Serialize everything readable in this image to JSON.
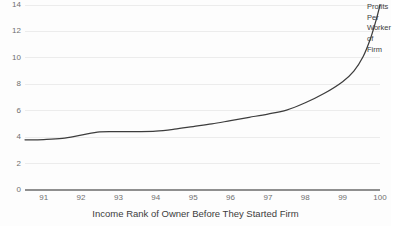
{
  "chart_data": {
    "type": "line",
    "title": "",
    "xlabel": "Income Rank of Owner Before They Started Firm",
    "ylabel": "",
    "xlim": [
      90.5,
      100
    ],
    "ylim": [
      0,
      14
    ],
    "grid": true,
    "legend_position": "right-of-line-end",
    "x_ticks": [
      "91",
      "92",
      "93",
      "94",
      "95",
      "96",
      "97",
      "98",
      "99",
      "100"
    ],
    "y_ticks": [
      "0",
      "2",
      "4",
      "6",
      "8",
      "10",
      "12",
      "14"
    ],
    "series": [
      {
        "name": "Profits Per Worker of Firm",
        "color": "#3d3d3d",
        "x": [
          90.5,
          91,
          91.5,
          92,
          92.5,
          93,
          93.5,
          94,
          94.5,
          95,
          95.5,
          96,
          96.5,
          97,
          97.5,
          98,
          98.5,
          99,
          99.3,
          99.55,
          99.75,
          99.9,
          100
        ],
        "values": [
          3.8,
          3.82,
          3.9,
          4.15,
          4.4,
          4.42,
          4.42,
          4.45,
          4.6,
          4.8,
          5.0,
          5.25,
          5.5,
          5.75,
          6.05,
          6.6,
          7.3,
          8.2,
          9.0,
          10.1,
          11.5,
          12.9,
          14.0
        ]
      }
    ]
  },
  "series_label": {
    "lines": [
      "Profits",
      "Per",
      "Worker",
      "of",
      "Firm"
    ]
  },
  "colors": {
    "background": "#fdfdfd",
    "gridline": "#ececec",
    "axis": "#8f8f8f",
    "line": "#3d3d3d",
    "tick_text": "#6f6f6f",
    "title_text": "#3c3c3c"
  }
}
